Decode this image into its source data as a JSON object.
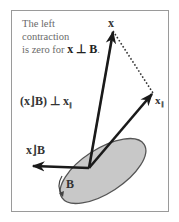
{
  "caption": {
    "line1": "The left",
    "line2": "contraction",
    "line3_prefix": "is zero for ",
    "line3_math": "x ⊥ B",
    "line3_suffix": "."
  },
  "labels": {
    "x": "x",
    "x_parallel": "x",
    "x_parallel_sub": "∥",
    "contraction_perp": "(x⌋B) ⊥ x",
    "contraction_perp_sub": "∥",
    "contraction": "x⌋B",
    "bivector": "B"
  },
  "colors": {
    "vector": "#1a1a1a",
    "ellipse_fill": "#c8c8c8",
    "ellipse_stroke": "#555555",
    "frame": "#9a9a9a",
    "caption_text": "#6a6a6a"
  }
}
